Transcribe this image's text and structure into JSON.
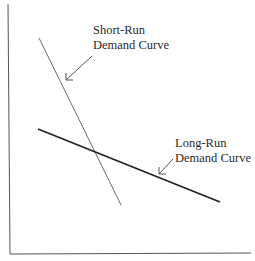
{
  "diagram": {
    "type": "economics-demand-curves",
    "labels": {
      "short_run_line1": "Short-Run",
      "short_run_line2": "Demand Curve",
      "long_run_line1": "Long-Run",
      "long_run_line2": "Demand Curve"
    },
    "colors": {
      "axis": "#555555",
      "short_run": "#6a6a6a",
      "long_run": "#222222",
      "text": "#2a2a2a"
    }
  }
}
